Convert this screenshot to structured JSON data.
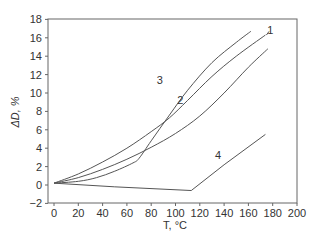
{
  "chart_data": {
    "type": "line",
    "title": "",
    "xlabel": "T, °C",
    "ylabel": "ΔD, %",
    "xlim": [
      0,
      200
    ],
    "ylim": [
      -2,
      18
    ],
    "xticks": [
      0,
      20,
      40,
      60,
      80,
      100,
      120,
      140,
      160,
      180,
      200
    ],
    "yticks": [
      -2,
      0,
      2,
      4,
      6,
      8,
      10,
      12,
      14,
      16,
      18
    ],
    "grid": false,
    "legend": "inline curve labels",
    "series": [
      {
        "name": "1",
        "x": [
          0,
          20,
          40,
          60,
          80,
          95,
          110,
          130,
          150,
          174
        ],
        "y": [
          0.2,
          1.2,
          2.5,
          4.0,
          5.8,
          7.3,
          9.2,
          11.8,
          14.0,
          16.3
        ]
      },
      {
        "name": "2",
        "x": [
          0,
          20,
          40,
          60,
          80,
          100,
          120,
          140,
          160,
          176
        ],
        "y": [
          0.2,
          0.8,
          1.7,
          2.8,
          4.1,
          5.6,
          7.5,
          10.0,
          12.8,
          14.8
        ]
      },
      {
        "name": "3",
        "x": [
          0,
          20,
          35,
          50,
          65,
          70,
          80,
          95,
          110,
          130,
          150,
          162
        ],
        "y": [
          0.2,
          0.4,
          0.8,
          1.5,
          2.4,
          2.9,
          4.8,
          7.6,
          10.3,
          13.3,
          15.5,
          16.7
        ]
      },
      {
        "name": "4",
        "x": [
          0,
          50,
          113,
          140,
          174
        ],
        "y": [
          0.2,
          -0.2,
          -0.6,
          2.2,
          5.5
        ]
      }
    ],
    "annotations": [
      {
        "text": "1",
        "x": 178,
        "y": 16.8
      },
      {
        "text": "2",
        "x": 104,
        "y": 9.2
      },
      {
        "text": "3",
        "x": 87,
        "y": 11.4
      },
      {
        "text": "4",
        "x": 135,
        "y": 3.3
      }
    ]
  }
}
